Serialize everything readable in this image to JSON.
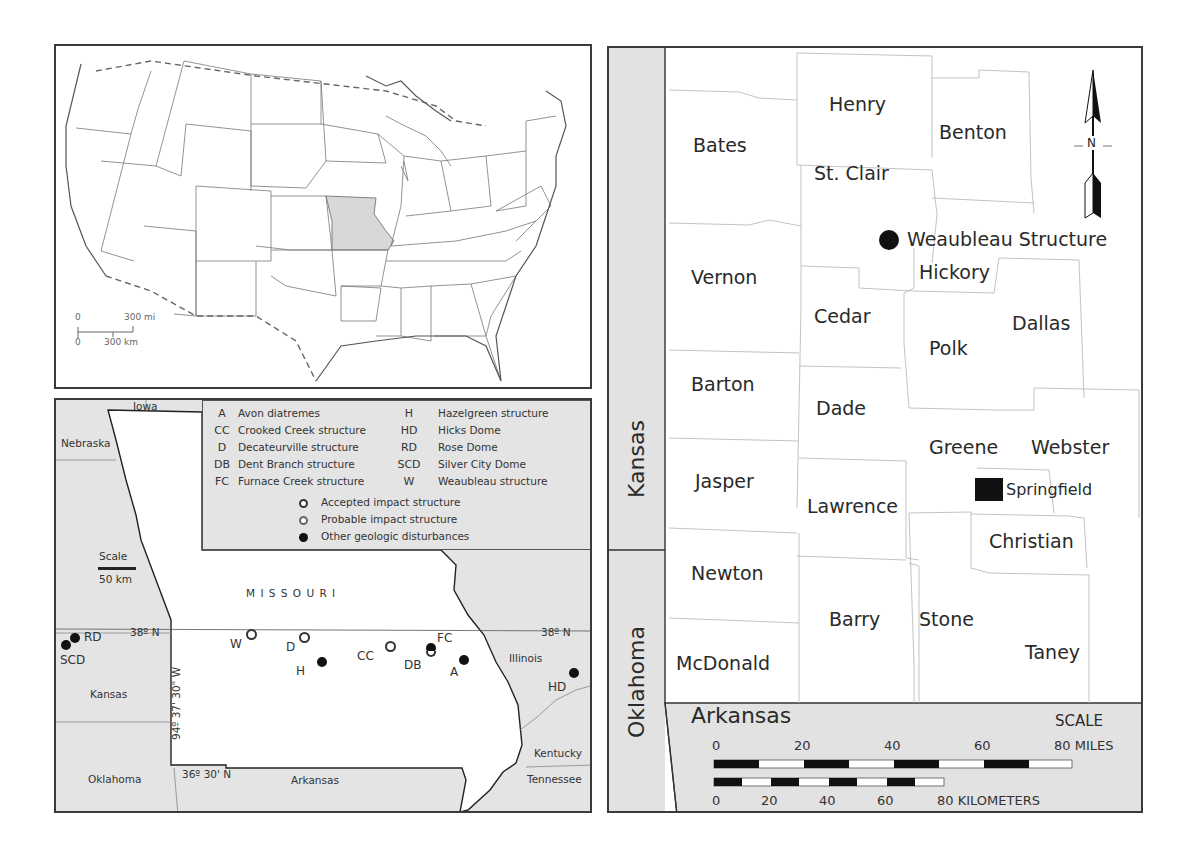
{
  "us_map": {
    "highlighted_state": "Missouri",
    "scale": {
      "top_zero": "0",
      "top_label": "300 mi",
      "bottom_zero": "0",
      "bottom_label": "300 km"
    }
  },
  "missouri_map": {
    "state_label": "M I S S O U R I",
    "neighbors": [
      "Iowa",
      "Nebraska",
      "Kansas",
      "Oklahoma",
      "Arkansas",
      "Illinois",
      "Kentucky",
      "Tennessee"
    ],
    "latitude_left": "38º N",
    "latitude_right": "38º N",
    "latitude_south": "36º 30' N",
    "longitude": "94º 37' 30\" W",
    "scale": {
      "title": "Scale",
      "label": "50 km"
    },
    "legend": {
      "codes": [
        {
          "code": "A",
          "name": "Avon diatremes"
        },
        {
          "code": "CC",
          "name": "Crooked Creek structure"
        },
        {
          "code": "D",
          "name": "Decateurville structure"
        },
        {
          "code": "DB",
          "name": "Dent Branch structure"
        },
        {
          "code": "FC",
          "name": "Furnace Creek structure"
        },
        {
          "code": "H",
          "name": "Hazelgreen structure"
        },
        {
          "code": "HD",
          "name": "Hicks Dome"
        },
        {
          "code": "RD",
          "name": "Rose Dome"
        },
        {
          "code": "SCD",
          "name": "Silver City Dome"
        },
        {
          "code": "W",
          "name": "Weaubleau structure"
        }
      ],
      "symbols": [
        {
          "type": "open",
          "label": "Accepted impact structure"
        },
        {
          "type": "open",
          "label": "Probable impact structure"
        },
        {
          "type": "filled",
          "label": "Other geologic disturbances"
        }
      ]
    },
    "sites": [
      {
        "code": "W",
        "type": "open"
      },
      {
        "code": "D",
        "type": "open"
      },
      {
        "code": "H",
        "type": "filled"
      },
      {
        "code": "CC",
        "type": "open"
      },
      {
        "code": "FC",
        "type": "filled"
      },
      {
        "code": "DB",
        "type": "open"
      },
      {
        "code": "A",
        "type": "filled"
      },
      {
        "code": "RD",
        "type": "filled"
      },
      {
        "code": "SCD",
        "type": "filled"
      },
      {
        "code": "HD",
        "type": "filled"
      }
    ]
  },
  "county_map": {
    "west_states": [
      "Kansas",
      "Oklahoma"
    ],
    "south_state": "Arkansas",
    "north_arrow": "N",
    "counties": [
      "Henry",
      "Bates",
      "Benton",
      "St. Clair",
      "Hickory",
      "Vernon",
      "Cedar",
      "Dallas",
      "Polk",
      "Barton",
      "Dade",
      "Greene",
      "Webster",
      "Jasper",
      "Lawrence",
      "Christian",
      "Newton",
      "Barry",
      "Stone",
      "McDonald",
      "Taney"
    ],
    "points": [
      {
        "label": "Weaubleau Structure",
        "symbol": "circle"
      },
      {
        "label": "Springfield",
        "symbol": "square"
      }
    ],
    "scale": {
      "title": "SCALE",
      "miles_ticks": [
        "0",
        "20",
        "40",
        "60",
        "80 MILES"
      ],
      "km_ticks": [
        "0",
        "20",
        "40",
        "60",
        "80 KILOMETERS"
      ]
    }
  }
}
